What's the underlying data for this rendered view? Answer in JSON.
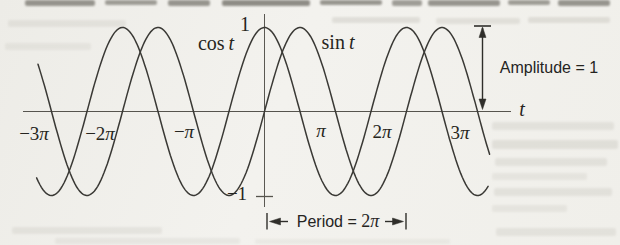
{
  "figure": {
    "y_tick_top": "1",
    "y_tick_bottom": "−1",
    "cos_label": {
      "fn": "cos",
      "var": "t"
    },
    "sin_label": {
      "fn": "sin",
      "var": "t"
    },
    "axis_var": "t",
    "amplitude_annotation": "Amplitude = 1",
    "period_annotation": {
      "prefix": "Period = ",
      "num": "2",
      "pi": "π"
    },
    "x_ticks": {
      "m3": {
        "num": "−3",
        "pi": "π"
      },
      "m2": {
        "num": "−2",
        "pi": "π"
      },
      "m1": {
        "num": "−",
        "pi": "π"
      },
      "p1": {
        "num": "",
        "pi": "π"
      },
      "p2": {
        "num": "2",
        "pi": "π"
      },
      "p3": {
        "num": "3",
        "pi": "π"
      }
    }
  },
  "chart_data": {
    "type": "line",
    "xlabel": "t",
    "ylim": [
      -1,
      1
    ],
    "grid": false,
    "x_tick_values_in_pi": [
      -3,
      -2,
      -1,
      1,
      2,
      3
    ],
    "x_tick_labels": [
      "−3π",
      "−2π",
      "−π",
      "π",
      "2π",
      "3π"
    ],
    "y_tick_values": [
      1,
      -1
    ],
    "y_tick_labels": [
      "1",
      "−1"
    ],
    "series": [
      {
        "name": "cos t",
        "fn": "cos",
        "amplitude": 1,
        "period_in_pi": 2,
        "x_range_in_pi": [
          -3.21,
          3.15
        ]
      },
      {
        "name": "sin t",
        "fn": "sin",
        "amplitude": 1,
        "period_in_pi": 2,
        "x_range_in_pi": [
          -3.19,
          3.17
        ]
      }
    ],
    "annotations": [
      {
        "text": "Amplitude = 1",
        "type": "vertical-extent",
        "from_y": 0,
        "to_y": 1
      },
      {
        "text": "Period = 2π",
        "type": "horizontal-extent",
        "from_x_in_pi": 0,
        "to_x_in_pi": 2
      }
    ]
  }
}
